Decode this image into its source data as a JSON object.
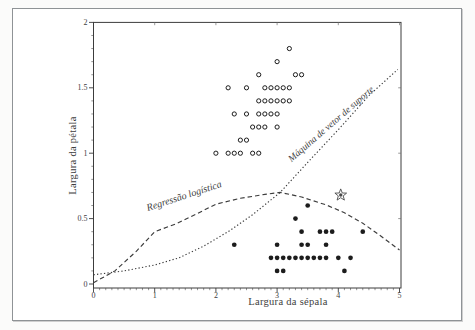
{
  "colors": {
    "ink": "#3c3c3c",
    "point_fill": "#1c1c1c",
    "text": "#3e3e3e",
    "frame_border": "#8f9396",
    "background": "#ffffff"
  },
  "chart_data": {
    "type": "scatter",
    "title": "",
    "xlabel": "Largura da sépala",
    "ylabel": "Largura da pétala",
    "xlim": [
      0,
      5
    ],
    "ylim": [
      0,
      2
    ],
    "x_ticks": [
      0,
      1,
      2,
      3,
      4,
      5
    ],
    "x_tick_labels": [
      "0",
      "1",
      "2",
      "3",
      "4",
      "5"
    ],
    "y_ticks": [
      0,
      0.5,
      1,
      1.5,
      2
    ],
    "y_tick_labels": [
      "0",
      "0.5",
      "1",
      "1.5",
      "2"
    ],
    "x_minor_step": 0.1,
    "y_minor_step": 0.1,
    "grid": false,
    "legend": "none (curves labeled inline)",
    "series": [
      {
        "name": "open-circles",
        "marker": "open-circle",
        "points": [
          [
            2.0,
            1.0
          ],
          [
            2.2,
            1.0
          ],
          [
            2.3,
            1.0
          ],
          [
            2.4,
            1.0
          ],
          [
            2.6,
            1.0
          ],
          [
            2.7,
            1.0
          ],
          [
            2.4,
            1.1
          ],
          [
            2.5,
            1.1
          ],
          [
            2.6,
            1.2
          ],
          [
            2.7,
            1.2
          ],
          [
            2.8,
            1.2
          ],
          [
            3.0,
            1.2
          ],
          [
            2.3,
            1.3
          ],
          [
            2.5,
            1.3
          ],
          [
            2.7,
            1.3
          ],
          [
            2.8,
            1.3
          ],
          [
            2.9,
            1.3
          ],
          [
            3.0,
            1.3
          ],
          [
            2.7,
            1.4
          ],
          [
            2.8,
            1.4
          ],
          [
            2.9,
            1.4
          ],
          [
            3.0,
            1.4
          ],
          [
            3.1,
            1.4
          ],
          [
            3.2,
            1.4
          ],
          [
            2.2,
            1.5
          ],
          [
            2.5,
            1.5
          ],
          [
            2.8,
            1.5
          ],
          [
            2.9,
            1.5
          ],
          [
            3.0,
            1.5
          ],
          [
            3.1,
            1.5
          ],
          [
            3.2,
            1.5
          ],
          [
            2.7,
            1.6
          ],
          [
            3.3,
            1.6
          ],
          [
            3.4,
            1.6
          ],
          [
            3.0,
            1.7
          ],
          [
            3.2,
            1.8
          ]
        ]
      },
      {
        "name": "filled-circles",
        "marker": "filled-circle",
        "points": [
          [
            3.0,
            0.1
          ],
          [
            3.1,
            0.1
          ],
          [
            4.1,
            0.1
          ],
          [
            2.9,
            0.2
          ],
          [
            3.0,
            0.2
          ],
          [
            3.1,
            0.2
          ],
          [
            3.2,
            0.2
          ],
          [
            3.3,
            0.2
          ],
          [
            3.4,
            0.2
          ],
          [
            3.5,
            0.2
          ],
          [
            3.6,
            0.2
          ],
          [
            3.7,
            0.2
          ],
          [
            3.8,
            0.2
          ],
          [
            4.0,
            0.2
          ],
          [
            4.2,
            0.2
          ],
          [
            2.3,
            0.3
          ],
          [
            3.0,
            0.3
          ],
          [
            3.4,
            0.3
          ],
          [
            3.5,
            0.3
          ],
          [
            3.8,
            0.3
          ],
          [
            3.4,
            0.4
          ],
          [
            3.7,
            0.4
          ],
          [
            3.8,
            0.4
          ],
          [
            3.9,
            0.4
          ],
          [
            4.4,
            0.4
          ],
          [
            3.3,
            0.5
          ],
          [
            3.5,
            0.6
          ]
        ]
      },
      {
        "name": "star-marker",
        "marker": "star",
        "points": [
          [
            4.04,
            0.68
          ]
        ]
      }
    ],
    "curves": [
      {
        "name": "Regressão logística",
        "style": "dashed",
        "label_angle_deg": -18,
        "points": [
          [
            0,
            0.01
          ],
          [
            0.35,
            0.1
          ],
          [
            0.7,
            0.25
          ],
          [
            1.0,
            0.4
          ],
          [
            1.35,
            0.46
          ],
          [
            1.7,
            0.54
          ],
          [
            2.0,
            0.61
          ],
          [
            2.4,
            0.655
          ],
          [
            2.8,
            0.685
          ],
          [
            3.05,
            0.7
          ],
          [
            3.4,
            0.665
          ],
          [
            3.8,
            0.605
          ],
          [
            4.1,
            0.545
          ],
          [
            4.4,
            0.465
          ],
          [
            4.7,
            0.365
          ],
          [
            5.0,
            0.26
          ]
        ]
      },
      {
        "name": "Máquina de vetor de suporte",
        "style": "dotted",
        "label_angle_deg": -41,
        "points": [
          [
            0,
            0.07
          ],
          [
            0.5,
            0.1
          ],
          [
            1.0,
            0.145
          ],
          [
            1.4,
            0.2
          ],
          [
            1.8,
            0.29
          ],
          [
            2.2,
            0.4
          ],
          [
            2.6,
            0.53
          ],
          [
            3.05,
            0.7
          ],
          [
            3.5,
            0.93
          ],
          [
            4.0,
            1.18
          ],
          [
            4.5,
            1.44
          ],
          [
            4.97,
            1.64
          ]
        ]
      }
    ]
  }
}
